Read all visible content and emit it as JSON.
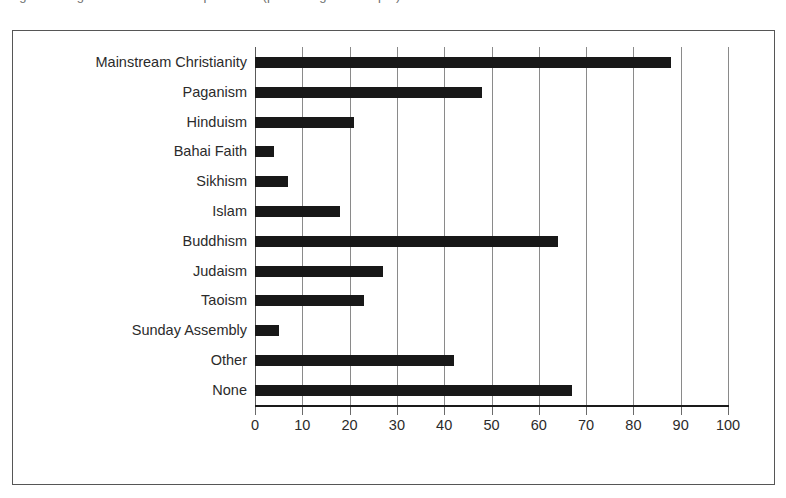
{
  "caption": {
    "fragment_text": "Figure: Religious affiliation of respondents (percentage of sample)",
    "visible": "partially-cropped"
  },
  "chart_data": {
    "type": "bar",
    "orientation": "horizontal",
    "title": "",
    "xlabel": "",
    "ylabel": "",
    "xlim": [
      0,
      100
    ],
    "xticks": [
      0,
      10,
      20,
      30,
      40,
      50,
      60,
      70,
      80,
      90,
      100
    ],
    "grid": "vertical",
    "legend": "none",
    "bar_color": "#181818",
    "categories": [
      "Mainstream Christianity",
      "Paganism",
      "Hinduism",
      "Bahai Faith",
      "Sikhism",
      "Islam",
      "Buddhism",
      "Judaism",
      "Taoism",
      "Sunday Assembly",
      "Other",
      "None"
    ],
    "values": [
      88,
      48,
      21,
      4,
      7,
      18,
      64,
      27,
      23,
      5,
      42,
      67
    ]
  }
}
